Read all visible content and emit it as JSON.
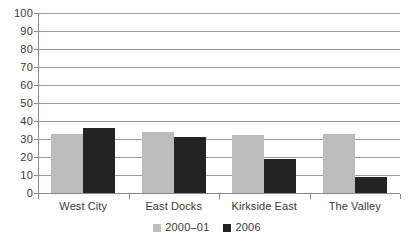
{
  "chart_data": {
    "type": "bar",
    "title": "",
    "subtitle": "",
    "xlabel": "",
    "ylabel": "",
    "categories": [
      "West City",
      "East Docks",
      "Kirkside East",
      "The Valley"
    ],
    "series": [
      {
        "name": "2000–01",
        "color": "#bcbcbc",
        "values": [
          33,
          34,
          32,
          33
        ]
      },
      {
        "name": "2006",
        "color": "#232323",
        "values": [
          36,
          31,
          19,
          9
        ]
      }
    ],
    "ylim": [
      0,
      100
    ],
    "ytick_step": 10,
    "yticks": [
      100,
      90,
      80,
      70,
      60,
      50,
      40,
      30,
      20,
      10,
      0
    ],
    "ytick_labels": [
      "100",
      "90",
      "80",
      "70",
      "60",
      "50",
      "40",
      "30",
      "20",
      "10",
      "0"
    ],
    "grid": true,
    "grid_axis": "y",
    "grid_color": "#9a9a9a",
    "legend_position": "bottom",
    "legend_entries": [
      "2000–01",
      "2006"
    ],
    "background_color": "#ffffff",
    "axis_color": "#8a8a8a",
    "text_color": "#3a3a3a"
  }
}
